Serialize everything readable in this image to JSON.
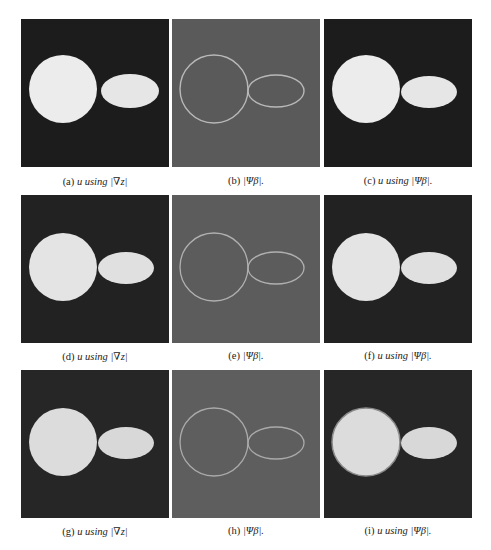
{
  "figure": {
    "colors": {
      "dark_bg": "#1c1c1c",
      "gray_bg": "#5a5a5a",
      "shape_fill": "#eeeeee",
      "contour": "#b8b8b8"
    },
    "rows": [
      {
        "panels": [
          {
            "id": "a",
            "type": "segmentation",
            "caption_label": "(a)",
            "caption_text": "u using |∇z|"
          },
          {
            "id": "b",
            "type": "edge-map",
            "caption_label": "(b)",
            "caption_text": "|Ψβ|."
          },
          {
            "id": "c",
            "type": "segmentation",
            "caption_label": "(c)",
            "caption_text": "u using |Ψβ|."
          }
        ]
      },
      {
        "panels": [
          {
            "id": "d",
            "type": "segmentation",
            "caption_label": "(d)",
            "caption_text": "u using |∇z|"
          },
          {
            "id": "e",
            "type": "edge-map",
            "caption_label": "(e)",
            "caption_text": "|Ψβ|."
          },
          {
            "id": "f",
            "type": "segmentation",
            "caption_label": "(f)",
            "caption_text": "u using |Ψβ|."
          }
        ]
      },
      {
        "panels": [
          {
            "id": "g",
            "type": "segmentation",
            "caption_label": "(g)",
            "caption_text": "u using |∇z|"
          },
          {
            "id": "h",
            "type": "edge-map",
            "caption_label": "(h)",
            "caption_text": "|Ψβ|."
          },
          {
            "id": "i",
            "type": "segmentation",
            "caption_label": "(i)",
            "caption_text": "u using |Ψβ|."
          }
        ]
      }
    ]
  }
}
